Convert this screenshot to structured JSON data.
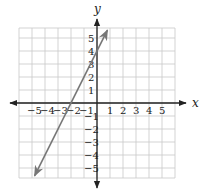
{
  "chart_data": {
    "type": "line",
    "title": "",
    "xlabel": "x",
    "ylabel": "y",
    "xlim": [
      -6,
      6
    ],
    "ylim": [
      -6,
      6
    ],
    "grid": true,
    "x_ticks": [
      "-5",
      "-4",
      "-3",
      "-2",
      "-1",
      "1",
      "2",
      "3",
      "4",
      "5"
    ],
    "y_ticks": [
      "5",
      "4",
      "3",
      "2",
      "1",
      "-1",
      "-2",
      "-3",
      "-4",
      "-5"
    ],
    "series": [
      {
        "name": "y = 2x + 4",
        "slope": 2,
        "intercept": 4,
        "x": [
          -4.8,
          -2,
          0,
          0.8
        ],
        "y": [
          -5.6,
          0,
          4,
          5.6
        ],
        "arrows": "both",
        "color": "#777777"
      }
    ]
  },
  "axes": {
    "x_label": "x",
    "y_label": "y",
    "colors": {
      "axis": "#222222",
      "grid": "#c8c8c8",
      "line": "#777777"
    }
  }
}
